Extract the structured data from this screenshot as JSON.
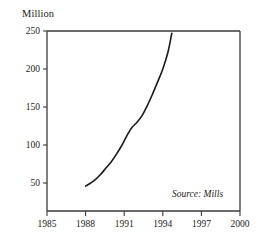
{
  "chart_data": {
    "type": "line",
    "title": "",
    "subtitle": "",
    "xlabel": "",
    "ylabel": "Million",
    "ylabel_position": "above-axis",
    "xlim": [
      1985,
      2000
    ],
    "ylim": [
      0,
      250
    ],
    "grid": false,
    "legend": false,
    "legend_position": "none",
    "annotations": [
      {
        "name": "source-note",
        "text": "Source: Mills",
        "style": "italic",
        "x": 1997.6,
        "y": 36
      }
    ],
    "x_ticks": [
      1985,
      1988,
      1991,
      1994,
      1997,
      2000
    ],
    "x_tick_labels": [
      "1985",
      "1988",
      "1991",
      "1994",
      "1997",
      "2000"
    ],
    "y_ticks": [
      50,
      100,
      150,
      200,
      250
    ],
    "y_tick_labels": [
      "50",
      "100",
      "150",
      "200",
      "250"
    ],
    "series": [
      {
        "name": "Million",
        "color": "#1a1a1a",
        "line_width": 1.6,
        "x": [
          1988.0,
          1988.4,
          1988.8,
          1989.2,
          1989.6,
          1990.0,
          1990.4,
          1990.8,
          1991.2,
          1991.6,
          1992.0,
          1992.4,
          1992.8,
          1993.2,
          1993.6,
          1994.0,
          1994.4,
          1994.7
        ],
        "values": [
          46,
          50,
          55,
          62,
          70,
          78,
          88,
          99,
          112,
          123,
          130,
          139,
          152,
          167,
          183,
          200,
          222,
          247
        ]
      }
    ]
  },
  "axes": {
    "frame_color": "#3a3a3a",
    "tick_color": "#3a3a3a",
    "background": "#ffffff"
  }
}
